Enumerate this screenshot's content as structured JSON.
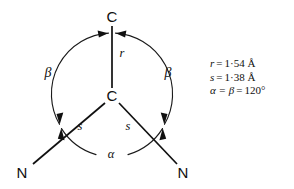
{
  "figure": {
    "type": "molecular-structure-diagram",
    "atoms": [
      {
        "id": "c-top",
        "label": "C",
        "x": 112,
        "y": 18
      },
      {
        "id": "c-center",
        "label": "C",
        "x": 112,
        "y": 97
      },
      {
        "id": "n-left",
        "label": "N",
        "x": 22,
        "y": 174
      },
      {
        "id": "n-right",
        "label": "N",
        "x": 183,
        "y": 174
      }
    ],
    "bonds": [
      {
        "id": "bond-r",
        "label": "r",
        "from": "c-center",
        "to": "c-top",
        "label_x": 122,
        "label_y": 54
      },
      {
        "id": "bond-s-left",
        "label": "s",
        "from": "c-center",
        "to": "n-left",
        "label_x": 80,
        "label_y": 127
      },
      {
        "id": "bond-s-right",
        "label": "s",
        "from": "c-center",
        "to": "n-right",
        "label_x": 128,
        "label_y": 127
      }
    ],
    "angles": [
      {
        "id": "angle-beta-left",
        "label": "β",
        "label_x": 48,
        "label_y": 74
      },
      {
        "id": "angle-beta-right",
        "label": "β",
        "label_x": 168,
        "label_y": 74
      },
      {
        "id": "angle-alpha",
        "label": "α",
        "label_x": 103,
        "label_y": 157
      }
    ],
    "stroke_color": "#101010"
  },
  "legend": {
    "rows": [
      {
        "symbol": "r",
        "eq": "=",
        "value": "1·54 Å"
      },
      {
        "symbol": "s",
        "eq": "=",
        "value": "1·38 Å"
      },
      {
        "symbol": "α = β",
        "eq": "=",
        "value": "120°"
      }
    ]
  }
}
